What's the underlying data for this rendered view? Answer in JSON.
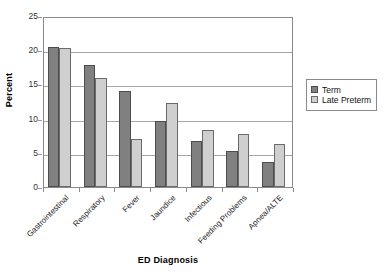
{
  "chart_data": {
    "type": "bar",
    "title": "",
    "xlabel": "ED Diagnosis",
    "ylabel": "Percent",
    "categories": [
      "Gastrointestinal",
      "Respiratory",
      "Fever",
      "Jaundice",
      "Infectious",
      "Feeding Problems",
      "Apnea/ALTE"
    ],
    "series": [
      {
        "name": "Term",
        "color": "#808080",
        "values": [
          20.5,
          17.9,
          14.0,
          9.7,
          6.7,
          5.2,
          3.6
        ]
      },
      {
        "name": "Late Preterm",
        "color": "#cfcfcf",
        "values": [
          20.3,
          15.9,
          7.0,
          12.3,
          8.3,
          7.8,
          6.3
        ]
      }
    ],
    "ylim": [
      0,
      25
    ],
    "yticks": [
      0,
      5,
      10,
      15,
      20,
      25
    ],
    "ytick_labels": [
      "0",
      "5",
      "10",
      "15",
      "20",
      "25"
    ],
    "grid": true,
    "grid_axis": "y",
    "legend_position": "right",
    "x_label_rotation": -45
  },
  "legend": {
    "entries": [
      {
        "label": "Term",
        "swatch_color": "#808080"
      },
      {
        "label": "Late Preterm",
        "swatch_color": "#cfcfcf"
      }
    ]
  },
  "axes": {
    "y_title": "Percent",
    "x_title": "ED Diagnosis"
  },
  "colors": {
    "series_term": "#808080",
    "series_late_preterm": "#cfcfcf",
    "axis_line": "#8a8a8a",
    "gridline": "#a6a6a6",
    "background": "#ffffff"
  }
}
